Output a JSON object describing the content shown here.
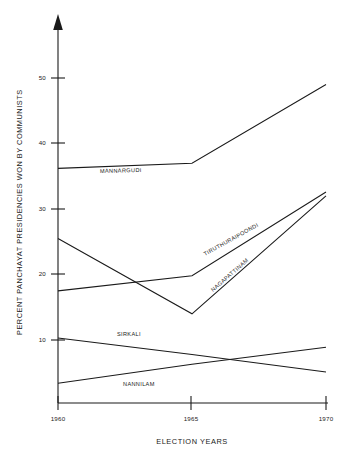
{
  "chart_data": {
    "type": "line",
    "title": "",
    "xlabel": "ELECTION YEARS",
    "ylabel": "PERCENT PANCHAYAT PRESIDENCIES WON BY COMMUNISTS",
    "x": [
      1960,
      1965,
      1970
    ],
    "xtick_labels": [
      "1960",
      "1965",
      "1970"
    ],
    "ytick_labels": [
      "10",
      "20",
      "30",
      "40",
      "50"
    ],
    "ytick_values": [
      10,
      20,
      30,
      40,
      50
    ],
    "xlim": [
      1960,
      1970
    ],
    "ylim": [
      0,
      57
    ],
    "grid": false,
    "legend_position": "inline-labels",
    "line_color": "#1a1a1a",
    "series": [
      {
        "name": "MANNARGUDI",
        "values": [
          36.2,
          37.0,
          49.0
        ]
      },
      {
        "name": "NAGAPATTINAM",
        "values": [
          25.5,
          14.0,
          32.0
        ]
      },
      {
        "name": "TIRUTHURAIPOONDI",
        "values": [
          17.5,
          19.8,
          32.6
        ]
      },
      {
        "name": "SIRKALI",
        "values": [
          10.3,
          7.8,
          5.1
        ]
      },
      {
        "name": "NANNILAM",
        "values": [
          3.4,
          6.3,
          8.9
        ]
      }
    ],
    "annotations": [
      {
        "text": "MANNARGUDI",
        "x": 100,
        "y": 173,
        "rotation": -1.5
      },
      {
        "text": "TIRUTHURAIPOONDI",
        "x": 205,
        "y": 256,
        "rotation": -29
      },
      {
        "text": "NAGAPATTINAM",
        "x": 213,
        "y": 292,
        "rotation": -41
      },
      {
        "text": "SIRKALI",
        "x": 117,
        "y": 336,
        "rotation": 0
      },
      {
        "text": "NANNILAM",
        "x": 123,
        "y": 386,
        "rotation": 0
      }
    ]
  },
  "axes": {
    "y_axis_name": "percent-axis",
    "x_axis_name": "year-axis",
    "arrow_icon": "up-arrow-icon"
  }
}
